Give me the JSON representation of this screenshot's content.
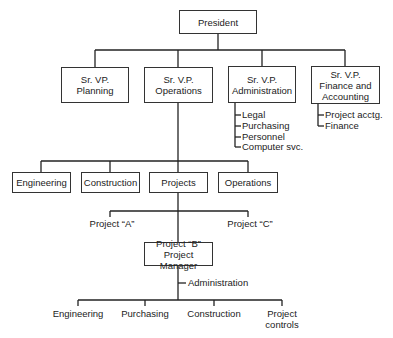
{
  "president": "President",
  "vps": {
    "planning": "Sr. VP.\nPlanning",
    "operations": "Sr. V.P.\nOperations",
    "administration": "Sr. V.P.\nAdministration",
    "finance": "Sr. V.P.\nFinance and\nAccounting"
  },
  "administration_items": [
    "Legal",
    "Purchasing",
    "Personnel",
    "Computer svc."
  ],
  "finance_items": [
    "Project acctg.",
    "Finance"
  ],
  "operations_departments": [
    "Engineering",
    "Construction",
    "Projects",
    "Operations"
  ],
  "projects": {
    "a": "Project “A”",
    "b": "Project “B”\nProject Manager",
    "c": "Project “C”"
  },
  "project_b_staff": "Administration",
  "project_b_functions": [
    "Engineering",
    "Purchasing",
    "Construction",
    "Project\ncontrols"
  ]
}
